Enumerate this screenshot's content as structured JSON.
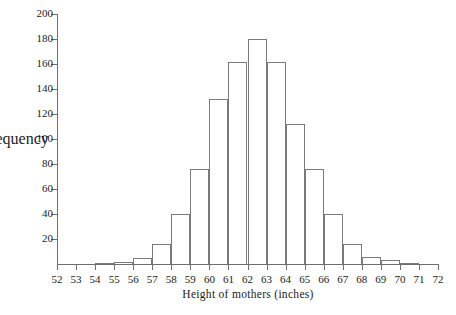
{
  "chart_data": {
    "type": "bar",
    "title": "",
    "xlabel": "Height of mothers (inches)",
    "ylabel": "Frequency",
    "xlim": [
      52,
      72
    ],
    "ylim": [
      0,
      200
    ],
    "bin_width": 1,
    "grid": false,
    "legend": null,
    "xticks": [
      52,
      53,
      54,
      55,
      56,
      57,
      58,
      59,
      60,
      61,
      62,
      63,
      64,
      65,
      66,
      67,
      68,
      69,
      70,
      71,
      72
    ],
    "yticks": [
      20,
      40,
      60,
      80,
      100,
      120,
      140,
      160,
      180,
      200
    ],
    "categories": [
      "52-53",
      "53-54",
      "54-55",
      "55-56",
      "56-57",
      "57-58",
      "58-59",
      "59-60",
      "60-61",
      "61-62",
      "62-63",
      "63-64",
      "64-65",
      "65-66",
      "66-67",
      "67-68",
      "68-69",
      "69-70",
      "70-71",
      "71-72"
    ],
    "bin_starts": [
      52,
      53,
      54,
      55,
      56,
      57,
      58,
      59,
      60,
      61,
      62,
      63,
      64,
      65,
      66,
      67,
      68,
      69,
      70,
      71
    ],
    "values": [
      0,
      0,
      1,
      2,
      5,
      16,
      40,
      76,
      132,
      162,
      180,
      162,
      112,
      76,
      40,
      16,
      6,
      3,
      1,
      0
    ]
  },
  "figure": {
    "axis_color": "#6e6e6e",
    "bar_outline_color": "#7a7a7a",
    "background": "#ffffff"
  }
}
